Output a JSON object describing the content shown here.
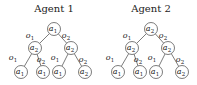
{
  "trees": [
    {
      "title": "Agent 1",
      "offset_x": 0,
      "nodes": [
        {
          "id": "root",
          "action": "a",
          "sub": "1",
          "x": 54,
          "y": 29
        },
        {
          "id": "l",
          "action": "a",
          "sub": "2",
          "x": 35,
          "y": 48
        },
        {
          "id": "r",
          "action": "a",
          "sub": "2",
          "x": 71,
          "y": 48
        },
        {
          "id": "ll",
          "action": "a",
          "sub": "1",
          "x": 21,
          "y": 72
        },
        {
          "id": "lr",
          "action": "a",
          "sub": "1",
          "x": 43,
          "y": 72
        },
        {
          "id": "rl",
          "action": "a",
          "sub": "1",
          "x": 59,
          "y": 72
        },
        {
          "id": "rr",
          "action": "a",
          "sub": "2",
          "x": 85,
          "y": 72
        }
      ],
      "edges": [
        {
          "from": "root",
          "to": "l",
          "obs": "o",
          "sub": "1",
          "lx": 30,
          "ly": 38
        },
        {
          "from": "root",
          "to": "r",
          "obs": "o",
          "sub": "2",
          "lx": 66,
          "ly": 38
        },
        {
          "from": "l",
          "to": "ll",
          "obs": "o",
          "sub": "1",
          "lx": 13,
          "ly": 60
        },
        {
          "from": "l",
          "to": "lr",
          "obs": "o",
          "sub": "2",
          "lx": 41,
          "ly": 62
        },
        {
          "from": "r",
          "to": "rl",
          "obs": "o",
          "sub": "1",
          "lx": 55,
          "ly": 60
        },
        {
          "from": "r",
          "to": "rr",
          "obs": "o",
          "sub": "2",
          "lx": 83,
          "ly": 62
        }
      ]
    },
    {
      "title": "Agent 2",
      "offset_x": 97,
      "nodes": [
        {
          "id": "root",
          "action": "a",
          "sub": "2",
          "x": 54,
          "y": 29
        },
        {
          "id": "l",
          "action": "a",
          "sub": "2",
          "x": 35,
          "y": 48
        },
        {
          "id": "r",
          "action": "a",
          "sub": "2",
          "x": 71,
          "y": 48
        },
        {
          "id": "ll",
          "action": "a",
          "sub": "1",
          "x": 21,
          "y": 72
        },
        {
          "id": "lr",
          "action": "a",
          "sub": "1",
          "x": 43,
          "y": 72
        },
        {
          "id": "rl",
          "action": "a",
          "sub": "1",
          "x": 59,
          "y": 72
        },
        {
          "id": "rr",
          "action": "a",
          "sub": "2",
          "x": 85,
          "y": 72
        }
      ],
      "edges": [
        {
          "from": "root",
          "to": "l",
          "obs": "o",
          "sub": "1",
          "lx": 30,
          "ly": 38
        },
        {
          "from": "root",
          "to": "r",
          "obs": "o",
          "sub": "2",
          "lx": 66,
          "ly": 38
        },
        {
          "from": "l",
          "to": "ll",
          "obs": "o",
          "sub": "1",
          "lx": 13,
          "ly": 60
        },
        {
          "from": "l",
          "to": "lr",
          "obs": "o",
          "sub": "2",
          "lx": 41,
          "ly": 62
        },
        {
          "from": "r",
          "to": "rl",
          "obs": "o",
          "sub": "1",
          "lx": 55,
          "ly": 60
        },
        {
          "from": "r",
          "to": "rr",
          "obs": "o",
          "sub": "2",
          "lx": 83,
          "ly": 62
        }
      ]
    }
  ]
}
